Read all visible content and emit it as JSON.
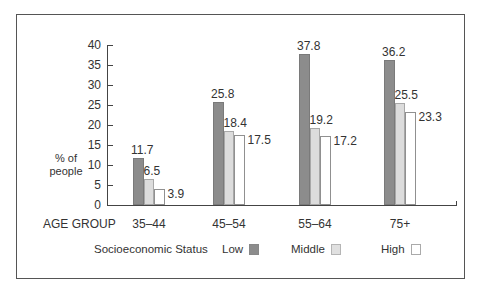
{
  "chart_data": {
    "type": "bar",
    "title": "",
    "xlabel": "AGE GROUP",
    "ylabel": "% of people",
    "ylim": [
      0,
      40
    ],
    "yticks": [
      0,
      5,
      10,
      15,
      20,
      25,
      30,
      35,
      40
    ],
    "categories": [
      "35–44",
      "45–54",
      "55–64",
      "75+"
    ],
    "legend_title": "Socioeconomic Status",
    "legend_position": "bottom",
    "grid": false,
    "series": [
      {
        "name": "Low",
        "color": "#8c8c8c",
        "values": [
          11.7,
          25.8,
          37.8,
          36.2
        ]
      },
      {
        "name": "Middle",
        "color": "#dcdcdc",
        "values": [
          6.5,
          18.4,
          19.2,
          25.5
        ]
      },
      {
        "name": "High",
        "color": "#ffffff",
        "values": [
          3.9,
          17.5,
          17.2,
          23.3
        ]
      }
    ]
  },
  "labels": {
    "ylabel_line1": "% of",
    "ylabel_line2": "people",
    "xlabel": "AGE GROUP",
    "legend_title": "Socioeconomic Status",
    "legend_low": "Low",
    "legend_middle": "Middle",
    "legend_high": "High",
    "yticks": [
      "0",
      "5",
      "10",
      "15",
      "20",
      "25",
      "30",
      "35",
      "40"
    ],
    "categories": [
      "35–44",
      "45–54",
      "55–64",
      "75+"
    ],
    "values": {
      "low": [
        "11.7",
        "25.8",
        "37.8",
        "36.2"
      ],
      "middle": [
        "6.5",
        "18.4",
        "19.2",
        "25.5"
      ],
      "high": [
        "3.9",
        "17.5",
        "17.2",
        "23.3"
      ]
    }
  }
}
